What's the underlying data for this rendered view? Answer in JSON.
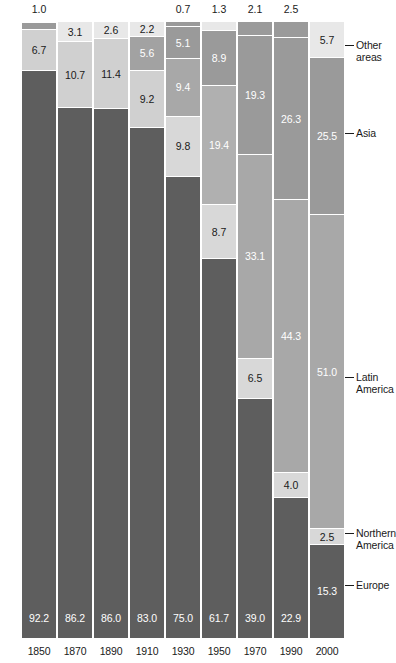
{
  "chart_data": {
    "type": "bar",
    "subtype": "stacked-percent",
    "title": "",
    "xlabel": "",
    "ylabel": "",
    "ylim": [
      0,
      100
    ],
    "grid": false,
    "legend_position": "right",
    "categories": [
      "1850",
      "1870",
      "1890",
      "1910",
      "1930",
      "1950",
      "1970",
      "1990",
      "2000"
    ],
    "series": [
      {
        "name": "Other areas",
        "color": "#e3e3e3",
        "values": [
          1.0,
          3.1,
          2.6,
          2.2,
          0.7,
          1.3,
          2.1,
          2.5,
          5.7
        ]
      },
      {
        "name": "Asia",
        "color": "#9a9a9a",
        "values": [
          null,
          null,
          null,
          5.6,
          5.1,
          8.9,
          19.3,
          26.3,
          25.5
        ]
      },
      {
        "name": "Latin America",
        "color": "#a8a8a8",
        "values": [
          6.7,
          10.7,
          11.4,
          9.2,
          9.4,
          19.4,
          33.1,
          44.3,
          51.0
        ]
      },
      {
        "name": "Northern America",
        "color": "#d5d5d5",
        "values": [
          null,
          null,
          null,
          null,
          9.8,
          8.7,
          6.5,
          4.0,
          2.5
        ]
      },
      {
        "name": "Europe",
        "color": "#5e5e5e",
        "values": [
          92.2,
          86.2,
          86.0,
          83.0,
          75.0,
          61.7,
          39.0,
          22.9,
          15.3
        ]
      }
    ]
  },
  "bars": [
    {
      "year": "1850",
      "segments": [
        {
          "series": "Other areas",
          "value": 1.0,
          "label": "1.0",
          "color": "#9a9a9a",
          "label_position": "outside-top",
          "text_color": "dark"
        },
        {
          "series": "Latin America",
          "value": 6.7,
          "label": "6.7",
          "color": "#d0d0d0",
          "label_position": "inside",
          "text_color": "dark"
        },
        {
          "series": "Europe",
          "value": 92.2,
          "label": "92.2",
          "color": "#5e5e5e",
          "label_position": "inside-bottom",
          "text_color": "light"
        }
      ]
    },
    {
      "year": "1870",
      "segments": [
        {
          "series": "Other areas",
          "value": 3.1,
          "label": "3.1",
          "color": "#e8e8e8",
          "label_position": "inside",
          "text_color": "dark"
        },
        {
          "series": "Latin America",
          "value": 10.7,
          "label": "10.7",
          "color": "#d0d0d0",
          "label_position": "inside",
          "text_color": "dark"
        },
        {
          "series": "Europe",
          "value": 86.2,
          "label": "86.2",
          "color": "#5e5e5e",
          "label_position": "inside-bottom",
          "text_color": "light"
        }
      ]
    },
    {
      "year": "1890",
      "segments": [
        {
          "series": "Other areas",
          "value": 2.6,
          "label": "2.6",
          "color": "#e8e8e8",
          "label_position": "inside",
          "text_color": "dark"
        },
        {
          "series": "Latin America",
          "value": 11.4,
          "label": "11.4",
          "color": "#d0d0d0",
          "label_position": "inside",
          "text_color": "dark"
        },
        {
          "series": "Europe",
          "value": 86.0,
          "label": "86.0",
          "color": "#5e5e5e",
          "label_position": "inside-bottom",
          "text_color": "light"
        }
      ]
    },
    {
      "year": "1910",
      "segments": [
        {
          "series": "Other areas",
          "value": 2.2,
          "label": "2.2",
          "color": "#e8e8e8",
          "label_position": "inside",
          "text_color": "dark"
        },
        {
          "series": "Asia",
          "value": 5.6,
          "label": "5.6",
          "color": "#a2a2a2",
          "label_position": "inside",
          "text_color": "light"
        },
        {
          "series": "Latin America",
          "value": 9.2,
          "label": "9.2",
          "color": "#d0d0d0",
          "label_position": "inside",
          "text_color": "dark"
        },
        {
          "series": "Europe",
          "value": 83.0,
          "label": "83.0",
          "color": "#5e5e5e",
          "label_position": "inside-bottom",
          "text_color": "light"
        }
      ]
    },
    {
      "year": "1930",
      "segments": [
        {
          "series": "Other areas",
          "value": 0.7,
          "label": "0.7",
          "color": "#9a9a9a",
          "label_position": "outside-top",
          "text_color": "dark"
        },
        {
          "series": "Asia",
          "value": 5.1,
          "label": "5.1",
          "color": "#9a9a9a",
          "label_position": "inside",
          "text_color": "light"
        },
        {
          "series": "Latin America",
          "value": 9.4,
          "label": "9.4",
          "color": "#a8a8a8",
          "label_position": "inside",
          "text_color": "light"
        },
        {
          "series": "Northern America",
          "value": 9.8,
          "label": "9.8",
          "color": "#d8d8d8",
          "label_position": "inside",
          "text_color": "dark"
        },
        {
          "series": "Europe",
          "value": 75.0,
          "label": "75.0",
          "color": "#5e5e5e",
          "label_position": "inside-bottom",
          "text_color": "light"
        }
      ]
    },
    {
      "year": "1950",
      "segments": [
        {
          "series": "Other areas",
          "value": 1.3,
          "label": "1.3",
          "color": "#e8e8e8",
          "label_position": "outside-top",
          "text_color": "dark"
        },
        {
          "series": "Asia",
          "value": 8.9,
          "label": "8.9",
          "color": "#9a9a9a",
          "label_position": "inside",
          "text_color": "light"
        },
        {
          "series": "Latin America",
          "value": 19.4,
          "label": "19.4",
          "color": "#b0b0b0",
          "label_position": "inside",
          "text_color": "light"
        },
        {
          "series": "Northern America",
          "value": 8.7,
          "label": "8.7",
          "color": "#d8d8d8",
          "label_position": "inside",
          "text_color": "dark"
        },
        {
          "series": "Europe",
          "value": 61.7,
          "label": "61.7",
          "color": "#5e5e5e",
          "label_position": "inside-bottom",
          "text_color": "light"
        }
      ]
    },
    {
      "year": "1970",
      "segments": [
        {
          "series": "Other areas",
          "value": 2.1,
          "label": "2.1",
          "color": "#9a9a9a",
          "label_position": "outside-top",
          "text_color": "dark"
        },
        {
          "series": "Asia",
          "value": 19.3,
          "label": "19.3",
          "color": "#9a9a9a",
          "label_position": "inside",
          "text_color": "light"
        },
        {
          "series": "Latin America",
          "value": 33.1,
          "label": "33.1",
          "color": "#a8a8a8",
          "label_position": "inside",
          "text_color": "light"
        },
        {
          "series": "Northern America",
          "value": 6.5,
          "label": "6.5",
          "color": "#d8d8d8",
          "label_position": "inside",
          "text_color": "dark"
        },
        {
          "series": "Europe",
          "value": 39.0,
          "label": "39.0",
          "color": "#5e5e5e",
          "label_position": "inside-bottom",
          "text_color": "light"
        }
      ]
    },
    {
      "year": "1990",
      "segments": [
        {
          "series": "Other areas",
          "value": 2.5,
          "label": "2.5",
          "color": "#9a9a9a",
          "label_position": "outside-top",
          "text_color": "dark"
        },
        {
          "series": "Asia",
          "value": 26.3,
          "label": "26.3",
          "color": "#9a9a9a",
          "label_position": "inside",
          "text_color": "light"
        },
        {
          "series": "Latin America",
          "value": 44.3,
          "label": "44.3",
          "color": "#a8a8a8",
          "label_position": "inside",
          "text_color": "light"
        },
        {
          "series": "Northern America",
          "value": 4.0,
          "label": "4.0",
          "color": "#d8d8d8",
          "label_position": "inside",
          "text_color": "dark"
        },
        {
          "series": "Europe",
          "value": 22.9,
          "label": "22.9",
          "color": "#5e5e5e",
          "label_position": "inside-bottom",
          "text_color": "light"
        }
      ]
    },
    {
      "year": "2000",
      "segments": [
        {
          "series": "Other areas",
          "value": 5.7,
          "label": "5.7",
          "color": "#e8e8e8",
          "label_position": "inside",
          "text_color": "dark"
        },
        {
          "series": "Asia",
          "value": 25.5,
          "label": "25.5",
          "color": "#9a9a9a",
          "label_position": "inside",
          "text_color": "light"
        },
        {
          "series": "Latin America",
          "value": 51.0,
          "label": "51.0",
          "color": "#a8a8a8",
          "label_position": "inside",
          "text_color": "light"
        },
        {
          "series": "Northern America",
          "value": 2.5,
          "label": "2.5",
          "color": "#d8d8d8",
          "label_position": "inside",
          "text_color": "dark"
        },
        {
          "series": "Europe",
          "value": 15.3,
          "label": "15.3",
          "color": "#5e5e5e",
          "label_position": "inside",
          "text_color": "light"
        }
      ]
    }
  ],
  "legend": [
    {
      "label": "Other\nareas",
      "line1": "Other",
      "line2": "areas",
      "y": 40
    },
    {
      "label": "Asia",
      "line1": "Asia",
      "line2": "",
      "y": 128
    },
    {
      "label": "Latin\nAmerica",
      "line1": "Latin",
      "line2": "America",
      "y": 372
    },
    {
      "label": "Northern\nAmerica",
      "line1": "Northern",
      "line2": "America",
      "y": 528
    },
    {
      "label": "Europe",
      "line1": "Europe",
      "line2": "",
      "y": 580
    }
  ]
}
